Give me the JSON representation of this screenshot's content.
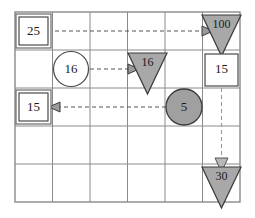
{
  "diagram": {
    "type": "grid-flow-diagram",
    "grid": {
      "columns": 6,
      "rows": 5,
      "left": 15,
      "top": 12,
      "right": 240,
      "bottom": 202,
      "line_color": "#8a8a8a"
    },
    "colors": {
      "shape_fill_gray": "#a8a8a8",
      "shape_fill_white": "#ffffff",
      "shape_stroke": "#4a4a4a",
      "grid_line": "#8a8a8a",
      "arrow_line": "#555555",
      "text": "#1a1a1a"
    },
    "nodes": [
      {
        "id": "box-25",
        "shape": "double-square",
        "label": "25",
        "fill": "white",
        "col": 1,
        "row": 1,
        "cx": 33.5,
        "cy": 31
      },
      {
        "id": "triangle-100",
        "shape": "triangle-down",
        "label": "100",
        "fill": "gray",
        "col": 6,
        "row": 1,
        "cx": 221.5,
        "cy": 31
      },
      {
        "id": "circle-16",
        "shape": "circle",
        "label": "16",
        "fill": "white",
        "col": 2,
        "row": 2,
        "cx": 71,
        "cy": 69
      },
      {
        "id": "triangle-16",
        "shape": "triangle-down",
        "label": "16",
        "fill": "gray",
        "col": 4,
        "row": 2,
        "cx": 146.5,
        "cy": 69
      },
      {
        "id": "box-15-right",
        "shape": "square",
        "label": "15",
        "fill": "white",
        "col": 6,
        "row": 2,
        "cx": 221.5,
        "cy": 69
      },
      {
        "id": "box-15-left",
        "shape": "double-square",
        "label": "15",
        "fill": "white",
        "col": 1,
        "row": 3,
        "cx": 33.5,
        "cy": 107
      },
      {
        "id": "circle-5",
        "shape": "circle",
        "label": "5",
        "fill": "gray",
        "col": 5,
        "row": 3,
        "cx": 184,
        "cy": 107
      },
      {
        "id": "triangle-30",
        "shape": "triangle-down",
        "label": "30",
        "fill": "gray",
        "col": 6,
        "row": 5,
        "cx": 221.5,
        "cy": 183
      }
    ],
    "arrows": [
      {
        "id": "arrow-25-to-100",
        "from": "box-25",
        "to": "triangle-100",
        "direction": "right",
        "style": "dashed",
        "x1": 55,
        "y1": 31,
        "x2": 207,
        "y2": 31
      },
      {
        "id": "arrow-circle16-to-triangle16",
        "from": "circle-16",
        "to": "triangle-16",
        "direction": "right",
        "style": "dashed",
        "x1": 90,
        "y1": 69,
        "x2": 133,
        "y2": 69
      },
      {
        "id": "arrow-circle5-to-box15",
        "from": "circle-5",
        "to": "box-15-left",
        "direction": "left",
        "style": "dashed",
        "x1": 166,
        "y1": 107,
        "x2": 55,
        "y2": 107
      },
      {
        "id": "arrow-box15-to-triangle30",
        "from": "box-15-right",
        "to": "triangle-30",
        "direction": "down",
        "style": "dashed",
        "x1": 221.5,
        "y1": 88,
        "x2": 221.5,
        "y2": 166
      }
    ]
  }
}
